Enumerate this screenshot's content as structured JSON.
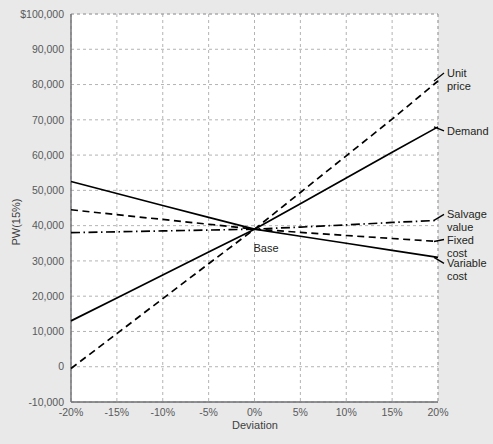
{
  "chart_data": {
    "type": "line",
    "title": "",
    "xlabel": "Deviation",
    "ylabel": "PW(15%)",
    "x": [
      -20,
      -15,
      -10,
      -5,
      0,
      5,
      10,
      15,
      20
    ],
    "xtick_labels": [
      "-20%",
      "-15%",
      "-10%",
      "-5%",
      "0%",
      "5%",
      "10%",
      "15%",
      "20%"
    ],
    "xlim": [
      -20,
      20
    ],
    "ylim": [
      -10000,
      100000
    ],
    "ytick_labels": [
      "$100,000",
      "90,000",
      "80,000",
      "70,000",
      "60,000",
      "50,000",
      "40,000",
      "30,000",
      "20,000",
      "10,000",
      "0",
      "-10,000"
    ],
    "ytick_values": [
      100000,
      90000,
      80000,
      70000,
      60000,
      50000,
      40000,
      30000,
      20000,
      10000,
      0,
      -10000
    ],
    "grid": true,
    "legend_position": "right-inline-labels",
    "annotations": [
      {
        "text": "Base",
        "x": 0,
        "y": 39000
      }
    ],
    "base_point": {
      "x": 0,
      "y": 39000
    },
    "series": [
      {
        "name": "Unit price",
        "label": "Unit\nprice",
        "label_line1": "Unit",
        "label_line2": "price",
        "style": "dashed",
        "color": "#000000",
        "values": [
          -500,
          9400,
          19300,
          29200,
          39000,
          49400,
          59800,
          70200,
          81000
        ]
      },
      {
        "name": "Demand",
        "label": "Demand",
        "label_line1": "Demand",
        "label_line2": "",
        "style": "solid",
        "color": "#000000",
        "values": [
          13000,
          19500,
          26000,
          32500,
          39000,
          46200,
          53500,
          60800,
          68000
        ]
      },
      {
        "name": "Salvage value",
        "label": "Salvage\nvalue",
        "label_line1": "Salvage",
        "label_line2": "value",
        "style": "dashdot",
        "color": "#000000",
        "values": [
          38000,
          38250,
          38500,
          38750,
          39000,
          39600,
          40200,
          40900,
          41500
        ]
      },
      {
        "name": "Fixed cost",
        "label": "Fixed\ncost",
        "label_line1": "Fixed",
        "label_line2": "cost",
        "style": "dashed",
        "color": "#000000",
        "values": [
          44500,
          43100,
          41750,
          40400,
          39000,
          38100,
          37200,
          36350,
          35500
        ]
      },
      {
        "name": "Variable cost",
        "label": "Variable\ncost",
        "label_line1": "Variable",
        "label_line2": "cost",
        "style": "solid",
        "color": "#000000",
        "values": [
          52500,
          49100,
          45700,
          42350,
          39000,
          37000,
          35000,
          33000,
          31000
        ]
      }
    ]
  },
  "colors": {
    "background": "#e9e9e9",
    "plot_background": "#ffffff",
    "gridline": "#9fa0a2",
    "axis": "#6d6e71",
    "series": "#000000",
    "tick_text": "#58595b",
    "label_text": "#231f20"
  }
}
